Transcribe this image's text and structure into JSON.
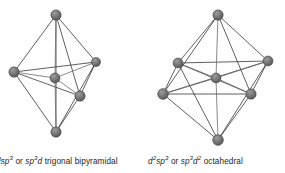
{
  "figure": {
    "kind": "orbital-hybridization-geometry-diagram",
    "background_color": "#ffffff",
    "edge_color": "#2b2b2b",
    "atom_fill_color": "#6e6e6e",
    "atom_edge_color": "#3a3a3a",
    "atom_highlight_color": "#9a9a9a",
    "structures": [
      {
        "id": "trigonal-bipyramidal",
        "geometry_name": "trigonal bipyramidal",
        "coordination_number": 5,
        "hybridizations": [
          "dsp3",
          "sp3d"
        ],
        "caption_plain": "dsp3 or sp3d trigonal bipyramidal",
        "atoms": [
          {
            "label": "axial-top",
            "x": 56,
            "y": 15,
            "r": 5.2,
            "role": "ligand"
          },
          {
            "label": "equatorial-left",
            "x": 14,
            "y": 72,
            "r": 5.2,
            "role": "ligand"
          },
          {
            "label": "equatorial-right",
            "x": 96,
            "y": 62,
            "r": 4.6,
            "role": "ligand"
          },
          {
            "label": "equatorial-front",
            "x": 80,
            "y": 96,
            "r": 5.2,
            "role": "ligand"
          },
          {
            "label": "axial-bottom",
            "x": 56,
            "y": 132,
            "r": 5.2,
            "role": "ligand"
          },
          {
            "label": "center",
            "x": 55,
            "y": 78,
            "r": 5.0,
            "role": "central"
          }
        ],
        "bonds": [
          [
            0,
            1
          ],
          [
            0,
            2
          ],
          [
            0,
            3
          ],
          [
            0,
            4
          ],
          [
            4,
            1
          ],
          [
            4,
            2
          ],
          [
            4,
            3
          ],
          [
            1,
            2
          ],
          [
            2,
            3
          ],
          [
            3,
            1
          ],
          [
            5,
            0
          ],
          [
            5,
            1
          ],
          [
            5,
            2
          ],
          [
            5,
            3
          ],
          [
            5,
            4
          ]
        ]
      },
      {
        "id": "octahedral",
        "geometry_name": "octahedral",
        "coordination_number": 6,
        "hybridizations": [
          "d2sp3",
          "sp3d2"
        ],
        "caption_plain": "d2sp3 or sp3d2 octahedral",
        "atoms": [
          {
            "label": "axial-top",
            "x": 218,
            "y": 15,
            "r": 5.2,
            "role": "ligand"
          },
          {
            "label": "equatorial-back-left",
            "x": 178,
            "y": 63,
            "r": 5.0,
            "role": "ligand"
          },
          {
            "label": "equatorial-back-right",
            "x": 268,
            "y": 61,
            "r": 5.0,
            "role": "ligand"
          },
          {
            "label": "equatorial-front-right",
            "x": 251,
            "y": 94,
            "r": 5.2,
            "role": "ligand"
          },
          {
            "label": "equatorial-front-left",
            "x": 163,
            "y": 94,
            "r": 5.4,
            "role": "ligand"
          },
          {
            "label": "axial-bottom",
            "x": 218,
            "y": 140,
            "r": 5.4,
            "role": "ligand"
          },
          {
            "label": "center",
            "x": 216,
            "y": 78,
            "r": 5.0,
            "role": "central"
          }
        ],
        "bonds": [
          [
            0,
            1
          ],
          [
            0,
            2
          ],
          [
            0,
            3
          ],
          [
            0,
            4
          ],
          [
            5,
            1
          ],
          [
            5,
            2
          ],
          [
            5,
            3
          ],
          [
            5,
            4
          ],
          [
            1,
            2
          ],
          [
            2,
            3
          ],
          [
            3,
            4
          ],
          [
            4,
            1
          ],
          [
            1,
            3
          ],
          [
            2,
            4
          ],
          [
            6,
            0
          ],
          [
            6,
            1
          ],
          [
            6,
            2
          ],
          [
            6,
            3
          ],
          [
            6,
            4
          ],
          [
            6,
            5
          ]
        ]
      }
    ]
  },
  "captions": {
    "left": {
      "hyb1_base": "d",
      "hyb1_sub": "sp",
      "hyb1_sup": "3",
      "conjunction": " or ",
      "hyb2_base": "sp",
      "hyb2_sup": "3",
      "hyb2_tail": "d",
      "geometry": " trigonal bipyramidal"
    },
    "right": {
      "hyb1_base": "d",
      "hyb1_sup1": "2",
      "hyb1_mid": "sp",
      "hyb1_sup2": "3",
      "conjunction": " or ",
      "hyb2_base": "sp",
      "hyb2_sup1": "3",
      "hyb2_mid": "d",
      "hyb2_sup2": "2",
      "geometry": " octahedral"
    }
  }
}
